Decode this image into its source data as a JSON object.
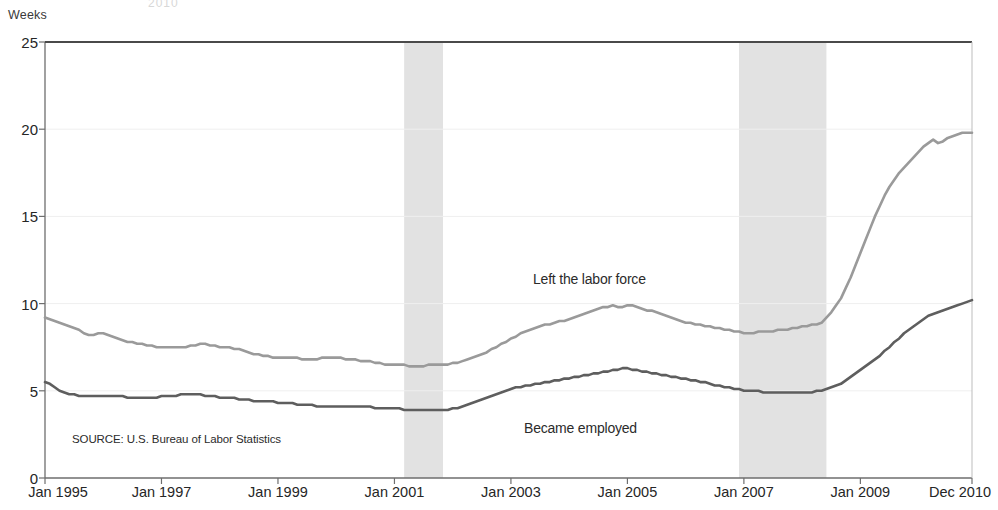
{
  "figure": {
    "top_clipped_text": "2010",
    "y_axis_unit": "Weeks",
    "source_note": "SOURCE: U.S. Bureau of Labor Statistics"
  },
  "annotations": [
    {
      "name": "left-the-labor-force",
      "text": "Left the labor force",
      "x_px": 533,
      "y_px": 271
    },
    {
      "name": "became-employed",
      "text": "Became employed",
      "x_px": 524,
      "y_px": 420
    }
  ],
  "chart_data": {
    "type": "line",
    "title": "",
    "subtitle": "",
    "xlabel": "",
    "ylabel": "Weeks",
    "ylim": [
      0,
      25
    ],
    "yticks": [
      0,
      5,
      10,
      15,
      20,
      25
    ],
    "xticks": [
      "Jan 1995",
      "Jan 1997",
      "Jan 1999",
      "Jan 2001",
      "Jan 2003",
      "Jan 2005",
      "Jan 2007",
      "Jan 2009",
      "Dec 2010"
    ],
    "xtick_positions": [
      0,
      24,
      48,
      72,
      96,
      120,
      144,
      168,
      191
    ],
    "xlim": [
      0,
      191
    ],
    "x_start": "Jan 1995",
    "x_end": "Dec 2010",
    "grid": true,
    "legend": "inline-annotations",
    "colors": {
      "left_the_labor_force": "#9a9a9a",
      "became_employed": "#5e5e5e",
      "recession_band": "#e2e2e2",
      "axis": "#6e6e6e",
      "grid": "#efefef"
    },
    "recession_bands": [
      {
        "label": "2001 recession",
        "start": "Mar 2001",
        "end": "Nov 2001",
        "x_start": 74,
        "x_end": 82
      },
      {
        "label": "2007-2009 recession",
        "start": "Dec 2007",
        "end": "Jun 2009",
        "x_start": 143,
        "x_end": 161
      }
    ],
    "series": [
      {
        "name": "Left the labor force",
        "color": "#9a9a9a",
        "values": [
          9.2,
          9.1,
          9.0,
          8.9,
          8.8,
          8.7,
          8.6,
          8.5,
          8.3,
          8.2,
          8.2,
          8.3,
          8.3,
          8.2,
          8.1,
          8.0,
          7.9,
          7.8,
          7.8,
          7.7,
          7.7,
          7.6,
          7.6,
          7.5,
          7.5,
          7.5,
          7.5,
          7.5,
          7.5,
          7.5,
          7.6,
          7.6,
          7.7,
          7.7,
          7.6,
          7.6,
          7.5,
          7.5,
          7.5,
          7.4,
          7.4,
          7.3,
          7.2,
          7.1,
          7.1,
          7.0,
          7.0,
          6.9,
          6.9,
          6.9,
          6.9,
          6.9,
          6.9,
          6.8,
          6.8,
          6.8,
          6.8,
          6.9,
          6.9,
          6.9,
          6.9,
          6.9,
          6.8,
          6.8,
          6.8,
          6.7,
          6.7,
          6.7,
          6.6,
          6.6,
          6.5,
          6.5,
          6.5,
          6.5,
          6.5,
          6.4,
          6.4,
          6.4,
          6.4,
          6.5,
          6.5,
          6.5,
          6.5,
          6.5,
          6.6,
          6.6,
          6.7,
          6.8,
          6.9,
          7.0,
          7.1,
          7.2,
          7.4,
          7.5,
          7.7,
          7.8,
          8.0,
          8.1,
          8.3,
          8.4,
          8.5,
          8.6,
          8.7,
          8.8,
          8.8,
          8.9,
          9.0,
          9.0,
          9.1,
          9.2,
          9.3,
          9.4,
          9.5,
          9.6,
          9.7,
          9.8,
          9.8,
          9.9,
          9.8,
          9.8,
          9.9,
          9.9,
          9.8,
          9.7,
          9.6,
          9.6,
          9.5,
          9.4,
          9.3,
          9.2,
          9.1,
          9.0,
          8.9,
          8.9,
          8.8,
          8.8,
          8.7,
          8.7,
          8.6,
          8.6,
          8.5,
          8.5,
          8.4,
          8.4,
          8.3,
          8.3,
          8.3,
          8.4,
          8.4,
          8.4,
          8.4,
          8.5,
          8.5,
          8.5,
          8.6,
          8.6,
          8.7,
          8.7,
          8.8,
          8.8,
          8.9,
          9.2,
          9.5,
          9.9,
          10.3,
          10.9,
          11.5,
          12.2,
          12.9,
          13.6,
          14.3,
          15.0,
          15.6,
          16.2,
          16.7,
          17.1,
          17.5,
          17.8,
          18.1,
          18.4,
          18.7,
          19.0,
          19.2,
          19.4,
          19.2,
          19.3,
          19.5,
          19.6,
          19.7,
          19.8,
          19.8,
          19.8
        ]
      },
      {
        "name": "Became employed",
        "color": "#5e5e5e",
        "values": [
          5.5,
          5.4,
          5.2,
          5.0,
          4.9,
          4.8,
          4.8,
          4.7,
          4.7,
          4.7,
          4.7,
          4.7,
          4.7,
          4.7,
          4.7,
          4.7,
          4.7,
          4.6,
          4.6,
          4.6,
          4.6,
          4.6,
          4.6,
          4.6,
          4.7,
          4.7,
          4.7,
          4.7,
          4.8,
          4.8,
          4.8,
          4.8,
          4.8,
          4.7,
          4.7,
          4.7,
          4.6,
          4.6,
          4.6,
          4.6,
          4.5,
          4.5,
          4.5,
          4.4,
          4.4,
          4.4,
          4.4,
          4.4,
          4.3,
          4.3,
          4.3,
          4.3,
          4.2,
          4.2,
          4.2,
          4.2,
          4.1,
          4.1,
          4.1,
          4.1,
          4.1,
          4.1,
          4.1,
          4.1,
          4.1,
          4.1,
          4.1,
          4.1,
          4.0,
          4.0,
          4.0,
          4.0,
          4.0,
          4.0,
          3.9,
          3.9,
          3.9,
          3.9,
          3.9,
          3.9,
          3.9,
          3.9,
          3.9,
          3.9,
          4.0,
          4.0,
          4.1,
          4.2,
          4.3,
          4.4,
          4.5,
          4.6,
          4.7,
          4.8,
          4.9,
          5.0,
          5.1,
          5.2,
          5.2,
          5.3,
          5.3,
          5.4,
          5.4,
          5.5,
          5.5,
          5.6,
          5.6,
          5.7,
          5.7,
          5.8,
          5.8,
          5.9,
          5.9,
          6.0,
          6.0,
          6.1,
          6.1,
          6.2,
          6.2,
          6.3,
          6.3,
          6.2,
          6.2,
          6.1,
          6.1,
          6.0,
          6.0,
          5.9,
          5.9,
          5.8,
          5.8,
          5.7,
          5.7,
          5.6,
          5.6,
          5.5,
          5.5,
          5.4,
          5.3,
          5.3,
          5.2,
          5.2,
          5.1,
          5.1,
          5.0,
          5.0,
          5.0,
          5.0,
          4.9,
          4.9,
          4.9,
          4.9,
          4.9,
          4.9,
          4.9,
          4.9,
          4.9,
          4.9,
          4.9,
          5.0,
          5.0,
          5.1,
          5.2,
          5.3,
          5.4,
          5.6,
          5.8,
          6.0,
          6.2,
          6.4,
          6.6,
          6.8,
          7.0,
          7.3,
          7.5,
          7.8,
          8.0,
          8.3,
          8.5,
          8.7,
          8.9,
          9.1,
          9.3,
          9.4,
          9.5,
          9.6,
          9.7,
          9.8,
          9.9,
          10.0,
          10.1,
          10.2
        ]
      }
    ]
  }
}
